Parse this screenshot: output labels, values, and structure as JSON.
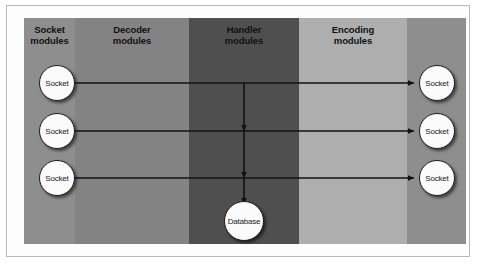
{
  "figure": {
    "background_color": "#ffffff",
    "frame_border_color": "#b9b9b9"
  },
  "columns": [
    {
      "id": "socket-modules",
      "label": "Socket\nmodules",
      "color": "#8e8e8e",
      "x": 0,
      "width": 51
    },
    {
      "id": "decoder-modules",
      "label": "Decoder\nmodules",
      "color": "#838383",
      "x": 51,
      "width": 114
    },
    {
      "id": "handler-modules",
      "label": "Handler\nmodules",
      "color": "#4f4f4f",
      "x": 165,
      "width": 110
    },
    {
      "id": "encoding-modules",
      "label": "Encoding\nmodules",
      "color": "#aeaeae",
      "x": 275,
      "width": 108
    },
    {
      "id": "output-sockets",
      "label": "",
      "color": "#8e8e8e",
      "x": 383,
      "width": 59
    }
  ],
  "nodes": {
    "input_sockets": [
      {
        "id": "socket-in-1",
        "label": "Socket",
        "cx": 33,
        "cy": 65
      },
      {
        "id": "socket-in-2",
        "label": "Socket",
        "cx": 33,
        "cy": 113
      },
      {
        "id": "socket-in-3",
        "label": "Socket",
        "cx": 33,
        "cy": 160
      }
    ],
    "output_sockets": [
      {
        "id": "socket-out-1",
        "label": "Socket",
        "cx": 413,
        "cy": 65
      },
      {
        "id": "socket-out-2",
        "label": "Socket",
        "cx": 413,
        "cy": 113
      },
      {
        "id": "socket-out-3",
        "label": "Socket",
        "cx": 413,
        "cy": 160
      }
    ],
    "database": {
      "id": "database-node",
      "label": "Database",
      "cx": 220,
      "cy": 203
    }
  },
  "edges": {
    "stroke_color": "#121212",
    "horizontal": [
      {
        "id": "flow-row-1",
        "from": "socket-in-1",
        "to": "socket-out-1",
        "y": 65,
        "x1": 51,
        "x2": 390
      },
      {
        "id": "flow-row-2",
        "from": "socket-in-2",
        "to": "socket-out-2",
        "y": 113,
        "x1": 51,
        "x2": 390
      },
      {
        "id": "flow-row-3",
        "from": "socket-in-3",
        "to": "socket-out-3",
        "y": 160,
        "x1": 51,
        "x2": 390
      }
    ],
    "vertical": [
      {
        "id": "handler-down-1",
        "x": 220,
        "y1": 65,
        "y2": 113
      },
      {
        "id": "handler-down-2",
        "x": 220,
        "y1": 113,
        "y2": 160
      },
      {
        "id": "handler-down-3",
        "x": 220,
        "y1": 160,
        "y2": 185
      }
    ]
  }
}
